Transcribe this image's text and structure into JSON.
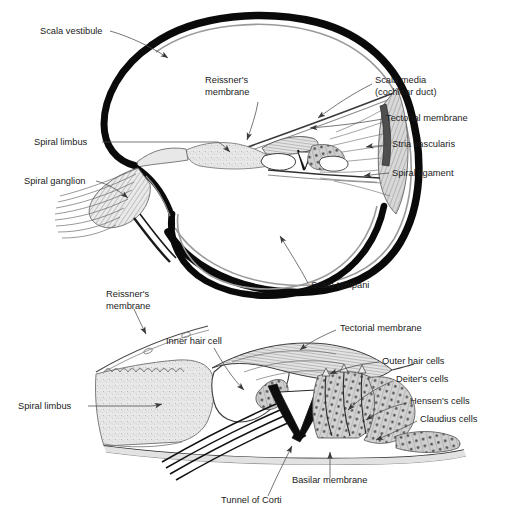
{
  "figure": {
    "background_color": "#ffffff",
    "ink_color": "#1b1b1b",
    "leader_color": "#4a4a4a",
    "width": 506,
    "height": 523
  },
  "upper_panel": {
    "name": "cochlear-cross-section",
    "labels": [
      {
        "id": "scala-vestibuli",
        "text": "Scala vestibule",
        "x": 40,
        "y": 34,
        "anchor": "start"
      },
      {
        "id": "reissners-membrane",
        "text_line1": "Reissner's",
        "text_line2": "membrane",
        "x": 205,
        "y": 83,
        "anchor": "start"
      },
      {
        "id": "scala-media",
        "text_line1": "Scala media",
        "text_line2": "(cochlear duct)",
        "x": 375,
        "y": 83,
        "anchor": "start"
      },
      {
        "id": "tectorial-membrane",
        "text": "Tectorial membrane",
        "x": 386,
        "y": 121,
        "anchor": "start"
      },
      {
        "id": "stria-vascularis",
        "text": "Stria vascularis",
        "x": 392,
        "y": 147,
        "anchor": "start"
      },
      {
        "id": "spiral-ligament",
        "text": "Spiral ligament",
        "x": 392,
        "y": 176,
        "anchor": "start"
      },
      {
        "id": "spiral-limbus",
        "text": "Spiral limbus",
        "x": 34,
        "y": 145,
        "anchor": "start"
      },
      {
        "id": "spiral-ganglion",
        "text": "Spiral ganglion",
        "x": 24,
        "y": 184,
        "anchor": "start"
      },
      {
        "id": "scala-tympani",
        "text": "Scala tympani",
        "x": 311,
        "y": 288,
        "anchor": "start"
      }
    ]
  },
  "lower_panel": {
    "name": "organ-of-corti-detail",
    "labels": [
      {
        "id": "reissners-membrane-2",
        "text_line1": "Reissner's",
        "text_line2": "membrane",
        "x": 106,
        "y": 297,
        "anchor": "start"
      },
      {
        "id": "inner-hair-cell",
        "text": "Inner hair cell",
        "x": 166,
        "y": 344,
        "anchor": "start"
      },
      {
        "id": "tectorial-membrane-2",
        "text": "Tectorial membrane",
        "x": 340,
        "y": 331,
        "anchor": "start"
      },
      {
        "id": "outer-hair-cells",
        "text": "Outer hair cells",
        "x": 382,
        "y": 364,
        "anchor": "start"
      },
      {
        "id": "deiters-cells",
        "text": "Deiter's cells",
        "x": 396,
        "y": 382,
        "anchor": "start"
      },
      {
        "id": "hensens-cells",
        "text": "Hensen's cells",
        "x": 410,
        "y": 404,
        "anchor": "start"
      },
      {
        "id": "claudius-cells",
        "text": "Claudius cells",
        "x": 420,
        "y": 422,
        "anchor": "start"
      },
      {
        "id": "spiral-limbus-2",
        "text": "Spiral limbus",
        "x": 18,
        "y": 409,
        "anchor": "start"
      },
      {
        "id": "basilar-membrane",
        "text": "Basilar membrane",
        "x": 292,
        "y": 483,
        "anchor": "start"
      },
      {
        "id": "tunnel-of-corti",
        "text": "Tunnel of Corti",
        "x": 221,
        "y": 503,
        "anchor": "start"
      }
    ]
  }
}
